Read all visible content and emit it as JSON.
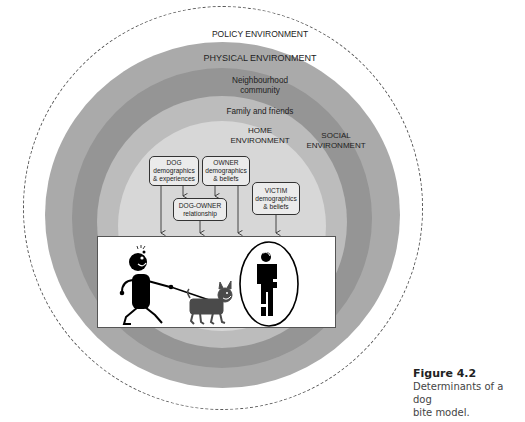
{
  "diagram": {
    "rings": [
      {
        "name": "policy",
        "label": "POLICY ENVIRONMENT",
        "color": "#ffffff",
        "border": "dashed #555"
      },
      {
        "name": "physical",
        "label": "PHYSICAL ENVIRONMENT",
        "color": "#a9a9a9"
      },
      {
        "name": "neighbourhood",
        "label_line1": "Neighbourhood",
        "label_line2": "community",
        "color": "#939393"
      },
      {
        "name": "family",
        "label": "Family and friends",
        "color": "#bdbdbd"
      },
      {
        "name": "home",
        "label_line1": "HOME",
        "label_line2": "ENVIRONMENT",
        "color": "#d6d6d6"
      }
    ],
    "social_label_line1": "SOCIAL",
    "social_label_line2": "ENVIRONMENT",
    "boxes": {
      "dog": {
        "line1": "DOG",
        "line2": "demographics",
        "line3": "& experiences"
      },
      "owner": {
        "line1": "OWNER",
        "line2": "demographics",
        "line3": "& beliefs"
      },
      "dog_owner": {
        "line1": "DOG-OWNER",
        "line2": "relationship"
      },
      "victim": {
        "line1": "VICTIM",
        "line2": "demographics",
        "line3": "& beliefs"
      }
    },
    "illustration": {
      "left": "person walking dog on leash",
      "right": "victim figure in oval"
    }
  },
  "caption": {
    "title": "Figure 4.2",
    "line1": "Determinants of a dog",
    "line2": "bite model."
  }
}
